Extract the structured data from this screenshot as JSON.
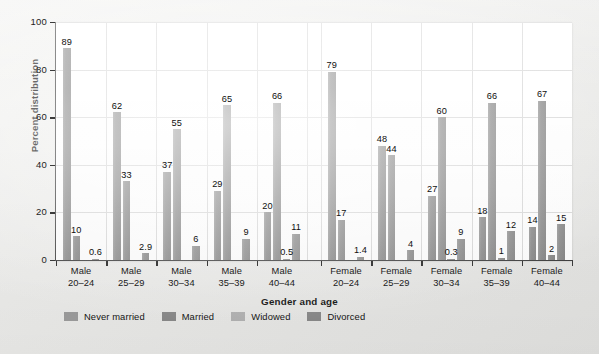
{
  "chart_data": {
    "type": "bar",
    "title": "",
    "xlabel": "Gender and age",
    "ylabel": "Percent distribution",
    "ylim": [
      0,
      100
    ],
    "yticks": [
      0,
      20,
      40,
      60,
      80,
      100
    ],
    "ytick_labels": [
      "0",
      "20",
      "40",
      "60",
      "80",
      "100"
    ],
    "grid": "horizontal-and-vertical",
    "legend_position": "bottom-left",
    "categories": [
      "Male 20–24",
      "Male 25–29",
      "Male 30–34",
      "Male 35–39",
      "Male 40–44",
      "Female 20–24",
      "Female 25–29",
      "Female 30–34",
      "Female 35–39",
      "Female 40–44"
    ],
    "series": [
      {
        "name": "Never married",
        "color": "#8b8b8b",
        "values": [
          89,
          62,
          37,
          29,
          20,
          79,
          48,
          27,
          18,
          14
        ],
        "labels": [
          "89",
          "62",
          "37",
          "29",
          "20",
          "79",
          "48",
          "27",
          "18",
          "14"
        ]
      },
      {
        "name": "Married",
        "color": "#8b8b8b",
        "values": [
          10,
          33,
          55,
          65,
          66,
          17,
          44,
          60,
          66,
          67
        ],
        "labels": [
          "10",
          "33",
          "55",
          "65",
          "66",
          "17",
          "44",
          "60",
          "66",
          "67"
        ]
      },
      {
        "name": "Widowed",
        "color": "#8b8b8b",
        "values": [
          0,
          0,
          0,
          0,
          0.5,
          0,
          0,
          0.3,
          1,
          2
        ],
        "labels": [
          "",
          "",
          "",
          "",
          "0.5",
          "",
          "",
          "0.3",
          "1",
          "2"
        ]
      },
      {
        "name": "Divorced",
        "color": "#8b8b8b",
        "values": [
          0.6,
          2.9,
          6,
          9,
          11,
          1.4,
          4,
          9,
          12,
          15
        ],
        "labels": [
          "0.6",
          "2.9",
          "6",
          "9",
          "11",
          "1.4",
          "4",
          "9",
          "12",
          "15"
        ]
      }
    ]
  },
  "axes": {
    "y_title": "Percent distribution",
    "x_title": "Gender and age",
    "y_tick_labels": [
      "100",
      "80",
      "60",
      "40",
      "20",
      "0"
    ]
  },
  "group_labels": [
    {
      "line1": "Male",
      "line2": "20–24"
    },
    {
      "line1": "Male",
      "line2": "25–29"
    },
    {
      "line1": "Male",
      "line2": "30–34"
    },
    {
      "line1": "Male",
      "line2": "35–39"
    },
    {
      "line1": "Male",
      "line2": "40–44"
    },
    {
      "line1": "Female",
      "line2": "20–24"
    },
    {
      "line1": "Female",
      "line2": "25–29"
    },
    {
      "line1": "Female",
      "line2": "30–34"
    },
    {
      "line1": "Female",
      "line2": "35–39"
    },
    {
      "line1": "Female",
      "line2": "40–44"
    }
  ],
  "legend": {
    "items": [
      {
        "label": "Never married",
        "color": "#9e9e9e"
      },
      {
        "label": "Married",
        "color": "#8b8b8b"
      },
      {
        "label": "Widowed",
        "color": "#b4b4b4"
      },
      {
        "label": "Divorced",
        "color": "#8b8b8b"
      }
    ]
  },
  "colors": {
    "bar": "#8b8b8b",
    "grid": "#d8d8d8",
    "axis": "#3b3b3b",
    "plot_background": "#ffffff",
    "page_background": "#ececea"
  }
}
